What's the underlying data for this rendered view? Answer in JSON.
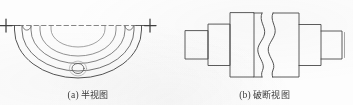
{
  "sheet": {
    "background_color": "#fdfdfd",
    "ink_color": "#4a4a4a",
    "figure_count": 2
  },
  "figures": [
    {
      "id": "half-view",
      "tag": "(a)",
      "caption": "半视图",
      "caption_full": "(a) 半视图",
      "description": "Half view of a symmetric circular flange part shown below a dashed symmetry centerline, with centerline cross marks at both ends.",
      "features": {
        "centerline_style": "dashed",
        "end_mark_glyph": "+",
        "end_mark_count": 2,
        "concentric_arc_count": 4,
        "small_hole_count": 1,
        "notch_count": 2
      }
    },
    {
      "id": "broken-view",
      "tag": "(b)",
      "caption": "破断视图",
      "caption_full": "(b) 破断视图",
      "description": "Broken view of a symmetric stepped shaft with a pair of wavy break lines removing the middle length.",
      "features": {
        "break_line_style": "wavy",
        "break_line_count": 2,
        "step_count": 6,
        "symmetry": "left-right"
      }
    }
  ],
  "colors": {
    "ink": "#4a4a4a",
    "ink_light": "#7d7d7d",
    "caption": "#3a3a3a",
    "paper": "#fdfdfd"
  }
}
